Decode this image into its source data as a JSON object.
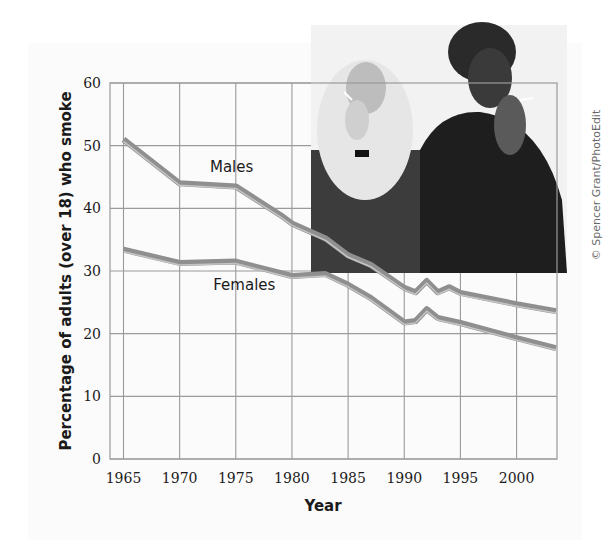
{
  "chart_data": {
    "type": "line",
    "title": "",
    "xlabel": "Year",
    "ylabel": "Percentage of adults (over 18) who smoke",
    "xlim": [
      1963.8,
      2003.6
    ],
    "ylim": [
      0,
      60
    ],
    "x_ticks": [
      1965,
      1970,
      1975,
      1980,
      1985,
      1990,
      1995,
      2000
    ],
    "y_ticks": [
      0,
      10,
      20,
      30,
      40,
      50,
      60
    ],
    "grid": true,
    "legend": "inline labels",
    "series": [
      {
        "name": "Males",
        "color": "#8f8f8f",
        "points": [
          [
            1965,
            51.0
          ],
          [
            1970,
            44.0
          ],
          [
            1975,
            43.5
          ],
          [
            1979,
            38.9
          ],
          [
            1980,
            37.6
          ],
          [
            1983,
            35.2
          ],
          [
            1985,
            32.5
          ],
          [
            1987,
            31.0
          ],
          [
            1990,
            27.3
          ],
          [
            1991,
            26.6
          ],
          [
            1992,
            28.4
          ],
          [
            1993,
            26.6
          ],
          [
            1994,
            27.4
          ],
          [
            1995,
            26.5
          ],
          [
            2000,
            24.7
          ],
          [
            2003.5,
            23.6
          ]
        ]
      },
      {
        "name": "Females",
        "color": "#8f8f8f",
        "points": [
          [
            1965,
            33.4
          ],
          [
            1970,
            31.3
          ],
          [
            1975,
            31.5
          ],
          [
            1980,
            29.2
          ],
          [
            1983,
            29.5
          ],
          [
            1985,
            27.8
          ],
          [
            1987,
            25.7
          ],
          [
            1990,
            21.8
          ],
          [
            1991,
            22.0
          ],
          [
            1992,
            23.9
          ],
          [
            1993,
            22.5
          ],
          [
            1995,
            21.7
          ],
          [
            2000,
            19.3
          ],
          [
            2003.5,
            17.7
          ]
        ]
      }
    ],
    "annotations": [
      {
        "text": "Males",
        "x": 1972.7,
        "y": 45.8
      },
      {
        "text": "Females",
        "x": 1973.0,
        "y": 27.0
      }
    ]
  },
  "photo": {
    "description": "Two women smoking cigarettes (black & white photo)",
    "credit": "© Spencer Grant/PhotoEdit"
  },
  "colors": {
    "grid": "#9a9a9a",
    "line": "#8f8f8f",
    "line_highlight": "#c4c4c4",
    "panel": "#fbfbfb"
  }
}
